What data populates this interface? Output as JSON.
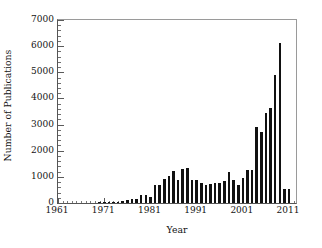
{
  "chart_data": {
    "type": "bar",
    "title": "",
    "subtitle": "",
    "xlabel": "Year",
    "ylabel": "Number of Publications",
    "xlim": [
      1961,
      2012.5
    ],
    "ylim": [
      0,
      7000
    ],
    "grid": false,
    "legend": null,
    "legend_position": "none",
    "bar_color": "#111111",
    "frame_color": "#555555",
    "background_color": "#ffffff",
    "x_tick_labels": [
      "1961",
      "1971",
      "1981",
      "1991",
      "2001",
      "2011"
    ],
    "x_tick_values": [
      1961,
      1971,
      1981,
      1991,
      2001,
      2011
    ],
    "x_minor_tick_interval": 1,
    "y_tick_labels": [
      "0",
      "1000",
      "2000",
      "3000",
      "4000",
      "5000",
      "6000",
      "7000"
    ],
    "y_tick_values": [
      0,
      1000,
      2000,
      3000,
      4000,
      5000,
      6000,
      7000
    ],
    "y_minor_tick_interval": 200,
    "categories": [
      1961,
      1962,
      1963,
      1964,
      1965,
      1966,
      1967,
      1968,
      1969,
      1970,
      1971,
      1972,
      1973,
      1974,
      1975,
      1976,
      1977,
      1978,
      1979,
      1980,
      1981,
      1982,
      1983,
      1984,
      1985,
      1986,
      1987,
      1988,
      1989,
      1990,
      1991,
      1992,
      1993,
      1994,
      1995,
      1996,
      1997,
      1998,
      1999,
      2000,
      2001,
      2002,
      2003,
      2004,
      2005,
      2006,
      2007,
      2008,
      2009,
      2010,
      2011
    ],
    "values": [
      0,
      0,
      0,
      0,
      0,
      0,
      0,
      0,
      0,
      30,
      40,
      40,
      45,
      50,
      60,
      130,
      160,
      150,
      300,
      300,
      230,
      700,
      690,
      900,
      1050,
      1220,
      880,
      1320,
      1350,
      880,
      880,
      760,
      700,
      720,
      780,
      760,
      840,
      1170,
      880,
      680,
      950,
      1250,
      1270,
      920,
      930,
      1000,
      1400,
      1800,
      2250,
      2200,
      550
    ],
    "values_note": "Bar heights read against the 0-7000 axis; 2011 is a partial year."
  },
  "extra_bars": {
    "comment": "Additional bars visible between 2003 and 2011 in the rising tail",
    "categories": [
      2004,
      2005,
      2006,
      2007,
      2008,
      2009,
      2010
    ],
    "values": [
      2900,
      2720,
      3430,
      3650,
      4900,
      6120,
      550
    ]
  }
}
